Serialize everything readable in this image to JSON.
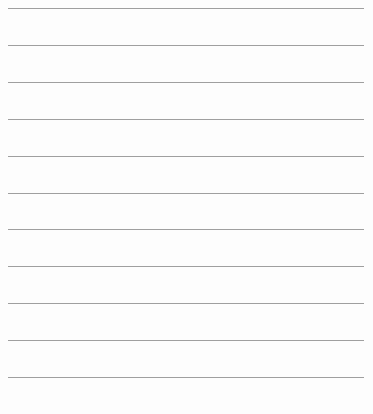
{
  "page": {
    "type": "lined-paper",
    "background_color": "#fdfdfd",
    "line_color": "#8e8e8e",
    "line_count": 11,
    "lines": [
      {
        "y": 8
      },
      {
        "y": 45
      },
      {
        "y": 82
      },
      {
        "y": 119
      },
      {
        "y": 156
      },
      {
        "y": 193
      },
      {
        "y": 229
      },
      {
        "y": 266
      },
      {
        "y": 303
      },
      {
        "y": 340
      },
      {
        "y": 377
      }
    ],
    "text": ""
  }
}
